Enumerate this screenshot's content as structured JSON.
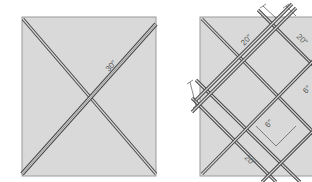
{
  "diagram": {
    "panels": [
      {
        "id": "x-panel",
        "description": "Square with two diagonal double-stitched lines forming an X",
        "labels": {
          "diagonal": "30\""
        }
      },
      {
        "id": "grid-panel",
        "description": "Square with diagonal grid of double-stitched lines",
        "labels": {
          "top_left": "20\"",
          "top_right": "20\"",
          "right": "6\"",
          "center": "6\"",
          "bottom": "20\""
        }
      }
    ],
    "colors": {
      "square_fill": "#d9d9d9",
      "square_border": "#9a9a9a",
      "stitch_line": "#444444",
      "background": "#ffffff"
    }
  }
}
